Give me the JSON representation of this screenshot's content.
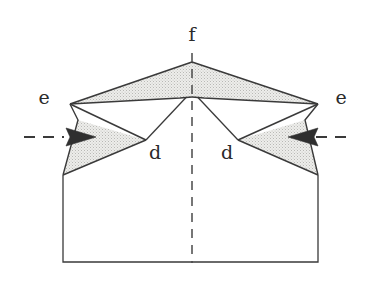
{
  "figure": {
    "background_color": "#ffffff",
    "line_color": "#3a3a3a",
    "shade_fill": "#e8e8e6",
    "shade_stroke": "#3a3a3a",
    "label_color": "#2b2b2b",
    "width": 370,
    "height": 284
  },
  "labels": {
    "apex": "f",
    "left_outer": "e",
    "right_outer": "e",
    "left_inner": "d",
    "right_inner": "d"
  },
  "label_positions": {
    "apex": {
      "x": 192,
      "y": 36
    },
    "left_outer": {
      "x": 44,
      "y": 99
    },
    "right_outer": {
      "x": 341,
      "y": 99
    },
    "left_inner": {
      "x": 155,
      "y": 154
    },
    "right_inner": {
      "x": 227,
      "y": 154
    }
  },
  "geometry": {
    "apex_f": {
      "x": 192,
      "y": 62
    },
    "left_e": {
      "x": 70,
      "y": 104
    },
    "right_e": {
      "x": 318,
      "y": 104
    },
    "left_d": {
      "x": 146,
      "y": 140
    },
    "right_d": {
      "x": 238,
      "y": 140
    },
    "center_ridge_left": {
      "x": 180,
      "y": 98
    },
    "center_ridge_right": {
      "x": 204,
      "y": 98
    },
    "center_ridge_top": {
      "x": 192,
      "y": 97
    },
    "body_left_x": 63,
    "body_right_x": 318,
    "body_top_y": 175,
    "body_bottom_y": 262,
    "centerline_x": 192,
    "centerline_top_y": 53,
    "centerline_bottom_y": 263
  },
  "shaded_regions": [
    {
      "name": "upper-left-wing",
      "points": "70,104 192,62 192,97 180,98"
    },
    {
      "name": "upper-right-wing",
      "points": "318,104 192,62 192,97 204,98"
    },
    {
      "name": "lower-left-gusset",
      "points": "63,175 146,140 78,120"
    },
    {
      "name": "lower-right-gusset",
      "points": "318,175 238,140 305,120"
    }
  ],
  "arrows": [
    {
      "name": "left-load-arrow",
      "direction": "right",
      "y": 137,
      "dash_start_x": 24,
      "dash_end_x": 62,
      "tip_x": 96,
      "tail_x": 66
    },
    {
      "name": "right-load-arrow",
      "direction": "left",
      "y": 137,
      "dash_start_x": 346,
      "dash_end_x": 308,
      "tip_x": 288,
      "tail_x": 318
    }
  ]
}
